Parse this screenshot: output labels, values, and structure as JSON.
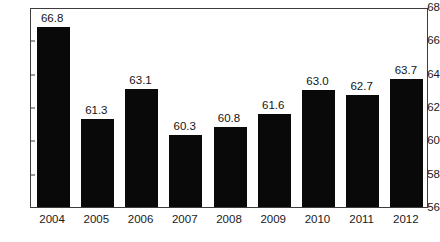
{
  "chart_data": {
    "type": "bar",
    "title": "",
    "subtitle": "",
    "xlabel": "",
    "ylabel": "",
    "categories": [
      "2004",
      "2005",
      "2006",
      "2007",
      "2008",
      "2009",
      "2010",
      "2011",
      "2012"
    ],
    "values": [
      66.8,
      61.3,
      63.1,
      60.3,
      60.8,
      61.6,
      63.0,
      62.7,
      63.7
    ],
    "data_labels": [
      "66.8",
      "61.3",
      "63.1",
      "60.3",
      "60.8",
      "61.6",
      "63.0",
      "62.7",
      "63.7"
    ],
    "ylim": [
      56,
      68
    ],
    "yticks": [
      56,
      58,
      60,
      62,
      64,
      66,
      68
    ],
    "ytick_labels": [
      "56",
      "58",
      "60",
      "62",
      "64",
      "66",
      "68"
    ],
    "grid": false,
    "legend": null,
    "legend_position": "none",
    "bar_color": "#090909",
    "axis_color": "#3d3d3d",
    "text_color": "#1a1a1a",
    "background_color": "#ffffff"
  }
}
